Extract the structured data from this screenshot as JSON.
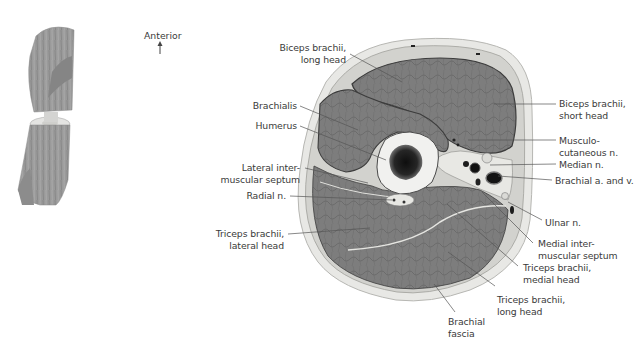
{
  "figure": {
    "orientation_label": "Anterior",
    "orientation_icon": "arrow-up-icon",
    "colors": {
      "muscle": "#7b7b7b",
      "fascia": "#d8d8d4",
      "skin_fat": "#e9e9e6",
      "bone_cortex": "#f2f2f0",
      "marrow": "#1e1e1e",
      "leader": "#555555",
      "text": "#3a3a3a"
    }
  },
  "labels": {
    "biceps_long_1": "Biceps brachii,",
    "biceps_long_2": "long head",
    "brachialis": "Brachialis",
    "humerus": "Humerus",
    "lat_septum_1": "Lateral inter-",
    "lat_septum_2": "muscular septum",
    "radial_n": "Radial n.",
    "triceps_lat_1": "Triceps brachii,",
    "triceps_lat_2": "lateral head",
    "biceps_short_1": "Biceps brachii,",
    "biceps_short_2": "short head",
    "musculo_1": "Musculo-",
    "musculo_2": "cutaneous n.",
    "median_n": "Median n.",
    "brachial_av": "Brachial a. and v.",
    "ulnar_n": "Ulnar n.",
    "med_septum_1": "Medial inter-",
    "med_septum_2": "muscular septum",
    "triceps_med_1": "Triceps brachii,",
    "triceps_med_2": "medial head",
    "triceps_long_1": "Triceps brachii,",
    "triceps_long_2": "long head",
    "fascia_1": "Brachial",
    "fascia_2": "fascia"
  }
}
